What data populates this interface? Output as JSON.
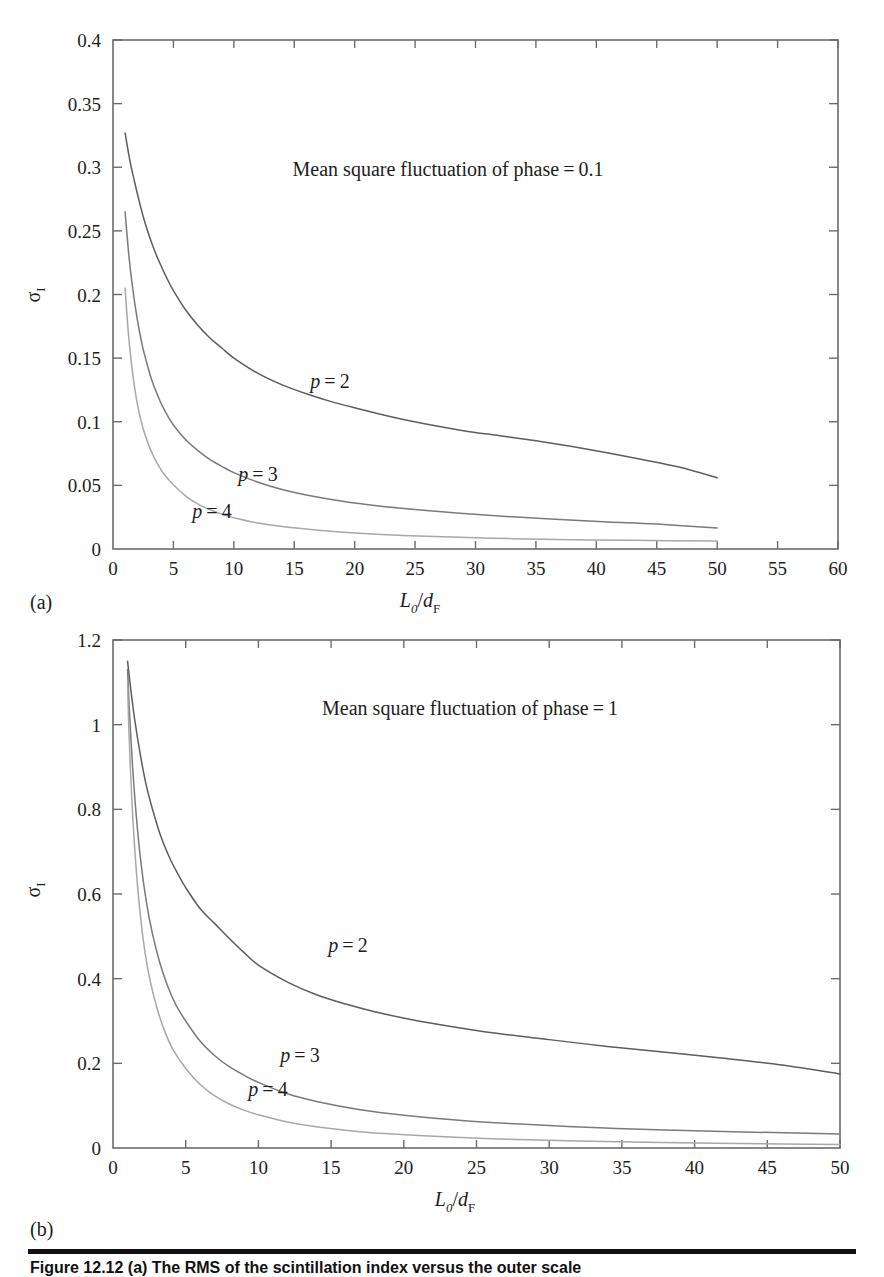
{
  "figure": {
    "panel_a_tag": "(a)",
    "panel_b_tag": "(b)",
    "caption": "Figure 12.12   (a) The RMS of the scintillation index versus the outer scale"
  },
  "panels": {
    "a": {
      "annotation": "Mean square fluctuation of phase = 0.1",
      "ylabel": "σ",
      "ylabel_sub": "I",
      "xlabel_main": "L",
      "xlabel_main_sub": "0",
      "xlabel_den": "d",
      "xlabel_den_sub": "F",
      "xticks": [
        "0",
        "5",
        "10",
        "15",
        "20",
        "25",
        "30",
        "35",
        "40",
        "45",
        "50",
        "55",
        "60"
      ],
      "yticks": [
        "0",
        "0.05",
        "0.1",
        "0.15",
        "0.2",
        "0.25",
        "0.3",
        "0.35",
        "0.4"
      ],
      "curve_labels": [
        "p = 2",
        "p = 3",
        "p = 4"
      ]
    },
    "b": {
      "annotation": "Mean square fluctuation of phase = 1",
      "ylabel": "σ",
      "ylabel_sub": "I",
      "xlabel_main": "L",
      "xlabel_main_sub": "0",
      "xlabel_den": "d",
      "xlabel_den_sub": "F",
      "xticks": [
        "0",
        "5",
        "10",
        "15",
        "20",
        "25",
        "30",
        "35",
        "40",
        "45",
        "50"
      ],
      "yticks": [
        "0",
        "0.2",
        "0.4",
        "0.6",
        "0.8",
        "1",
        "1.2"
      ],
      "curve_labels": [
        "p = 2",
        "p = 3",
        "p = 4"
      ]
    }
  },
  "chart_data": [
    {
      "type": "line",
      "panel": "a",
      "title": "Mean square fluctuation of phase = 0.1",
      "xlabel": "L0/dF",
      "ylabel": "sigma_I",
      "xlim": [
        0,
        60
      ],
      "ylim": [
        0,
        0.4
      ],
      "xticks": [
        0,
        5,
        10,
        15,
        20,
        25,
        30,
        35,
        40,
        45,
        50,
        55,
        60
      ],
      "yticks": [
        0,
        0.05,
        0.1,
        0.15,
        0.2,
        0.25,
        0.3,
        0.35,
        0.4
      ],
      "grid": false,
      "legend": "inline-curve-labels",
      "series": [
        {
          "name": "p = 2",
          "color": "#5d5d5d",
          "x": [
            1,
            1.4,
            1.8,
            2.2,
            2.6,
            3,
            3.5,
            4,
            4.5,
            5,
            6,
            7,
            8,
            9,
            10,
            12,
            14,
            16,
            18,
            20,
            23,
            26,
            29,
            32,
            35,
            38,
            41,
            44,
            47,
            50
          ],
          "y": [
            0.327,
            0.305,
            0.288,
            0.272,
            0.258,
            0.246,
            0.233,
            0.222,
            0.212,
            0.203,
            0.188,
            0.176,
            0.166,
            0.158,
            0.15,
            0.138,
            0.129,
            0.122,
            0.116,
            0.111,
            0.104,
            0.098,
            0.093,
            0.089,
            0.085,
            0.0805,
            0.0755,
            0.07,
            0.064,
            0.056
          ]
        },
        {
          "name": "p = 3",
          "color": "#7a7a7a",
          "x": [
            1,
            1.3,
            1.6,
            2,
            2.4,
            2.8,
            3.2,
            3.6,
            4,
            4.5,
            5,
            6,
            7,
            8,
            9,
            10,
            12,
            14,
            16,
            19,
            22,
            25,
            29,
            33,
            37,
            41,
            45,
            50
          ],
          "y": [
            0.265,
            0.232,
            0.207,
            0.181,
            0.161,
            0.146,
            0.133,
            0.123,
            0.114,
            0.105,
            0.0975,
            0.086,
            0.0775,
            0.0705,
            0.065,
            0.06,
            0.0525,
            0.0468,
            0.0425,
            0.0375,
            0.0338,
            0.031,
            0.0278,
            0.0253,
            0.0232,
            0.0213,
            0.0196,
            0.0165
          ]
        },
        {
          "name": "p = 4",
          "color": "#a8a8a8",
          "x": [
            1,
            1.25,
            1.5,
            1.8,
            2.1,
            2.5,
            2.9,
            3.3,
            3.8,
            4.3,
            5,
            6,
            7,
            8,
            9,
            10,
            12,
            14,
            17,
            20,
            24,
            28,
            33,
            38,
            43,
            50
          ],
          "y": [
            0.205,
            0.172,
            0.148,
            0.126,
            0.11,
            0.0945,
            0.083,
            0.074,
            0.065,
            0.058,
            0.0505,
            0.0418,
            0.0355,
            0.031,
            0.0274,
            0.0246,
            0.0204,
            0.0176,
            0.0147,
            0.0126,
            0.0107,
            0.00935,
            0.00815,
            0.00735,
            0.0068,
            0.0062
          ]
        }
      ]
    },
    {
      "type": "line",
      "panel": "b",
      "title": "Mean square fluctuation of phase = 1",
      "xlabel": "L0/dF",
      "ylabel": "sigma_I",
      "xlim": [
        0,
        50
      ],
      "ylim": [
        0,
        1.2
      ],
      "xticks": [
        0,
        5,
        10,
        15,
        20,
        25,
        30,
        35,
        40,
        45,
        50
      ],
      "yticks": [
        0,
        0.2,
        0.4,
        0.6,
        0.8,
        1,
        1.2
      ],
      "grid": false,
      "legend": "inline-curve-labels",
      "series": [
        {
          "name": "p = 2",
          "color": "#5d5d5d",
          "x": [
            1,
            1.2,
            1.5,
            1.9,
            2.3,
            2.8,
            3.3,
            3.9,
            4.5,
            5,
            6,
            7,
            8,
            9,
            10,
            12,
            14,
            16,
            18,
            21,
            24,
            27,
            30,
            34,
            38,
            42,
            46,
            50
          ],
          "y": [
            1.15,
            1.09,
            1.01,
            0.925,
            0.855,
            0.79,
            0.735,
            0.685,
            0.645,
            0.615,
            0.565,
            0.53,
            0.495,
            0.462,
            0.432,
            0.392,
            0.362,
            0.34,
            0.322,
            0.3,
            0.283,
            0.268,
            0.256,
            0.24,
            0.226,
            0.212,
            0.196,
            0.175
          ]
        },
        {
          "name": "p = 3",
          "color": "#7a7a7a",
          "x": [
            1,
            1.15,
            1.35,
            1.6,
            1.9,
            2.3,
            2.7,
            3.2,
            3.7,
            4.3,
            5,
            6,
            7,
            8,
            9,
            10,
            12,
            14,
            17,
            20,
            24,
            28,
            33,
            38,
            44,
            50
          ],
          "y": [
            1.13,
            1.02,
            0.9,
            0.785,
            0.68,
            0.58,
            0.508,
            0.44,
            0.388,
            0.34,
            0.3,
            0.252,
            0.218,
            0.192,
            0.172,
            0.155,
            0.128,
            0.11,
            0.0905,
            0.0775,
            0.065,
            0.0565,
            0.0483,
            0.0425,
            0.0375,
            0.033
          ]
        },
        {
          "name": "p = 4",
          "color": "#a8a8a8",
          "x": [
            1,
            1.1,
            1.3,
            1.55,
            1.85,
            2.2,
            2.6,
            3.1,
            3.6,
            4.2,
            5,
            6,
            7,
            8,
            9,
            10,
            12,
            14,
            17,
            21,
            26,
            32,
            39,
            46,
            50
          ],
          "y": [
            1.1,
            0.98,
            0.82,
            0.68,
            0.56,
            0.462,
            0.388,
            0.322,
            0.272,
            0.228,
            0.188,
            0.15,
            0.123,
            0.104,
            0.0895,
            0.0785,
            0.0615,
            0.05,
            0.0385,
            0.0295,
            0.0218,
            0.0163,
            0.0122,
            0.0096,
            0.0084
          ]
        }
      ]
    }
  ]
}
